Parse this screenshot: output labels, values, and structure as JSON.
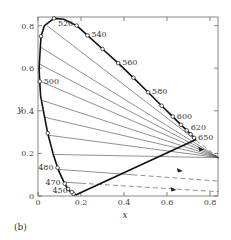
{
  "chart_data": {
    "type": "line",
    "title": "",
    "panel_label": "(b)",
    "xlabel": "x",
    "ylabel": "y",
    "xlim": [
      0,
      0.84
    ],
    "ylim": [
      0,
      0.84
    ],
    "grid": false,
    "x_ticks": [
      0,
      0.2,
      0.4,
      0.6,
      0.8
    ],
    "x_tick_labels": [
      "0",
      "0.2",
      "0.4",
      "0.6",
      "0.8"
    ],
    "y_ticks": [
      0,
      0.2,
      0.4,
      0.6,
      0.8
    ],
    "y_tick_labels": [
      "0",
      "0.2",
      "0.4",
      "0.6",
      "0.8"
    ],
    "series": [
      {
        "name": "spectral-locus",
        "style": "thick-solid",
        "points": [
          [
            0.175,
            0.005
          ],
          [
            0.165,
            0.01
          ],
          [
            0.15,
            0.02
          ],
          [
            0.135,
            0.04
          ],
          [
            0.124,
            0.058
          ],
          [
            0.1,
            0.11
          ],
          [
            0.091,
            0.133
          ],
          [
            0.07,
            0.2
          ],
          [
            0.045,
            0.295
          ],
          [
            0.025,
            0.4
          ],
          [
            0.012,
            0.47
          ],
          [
            0.008,
            0.538
          ],
          [
            0.005,
            0.6
          ],
          [
            0.01,
            0.68
          ],
          [
            0.014,
            0.75
          ],
          [
            0.03,
            0.8
          ],
          [
            0.074,
            0.834
          ],
          [
            0.12,
            0.83
          ],
          [
            0.18,
            0.8
          ],
          [
            0.23,
            0.754
          ],
          [
            0.3,
            0.69
          ],
          [
            0.373,
            0.624
          ],
          [
            0.444,
            0.555
          ],
          [
            0.512,
            0.487
          ],
          [
            0.575,
            0.424
          ],
          [
            0.627,
            0.373
          ],
          [
            0.665,
            0.334
          ],
          [
            0.692,
            0.308
          ],
          [
            0.71,
            0.29
          ],
          [
            0.735,
            0.265
          ]
        ]
      },
      {
        "name": "purple-line",
        "style": "thick-solid",
        "points": [
          [
            0.175,
            0.005
          ],
          [
            0.735,
            0.265
          ]
        ]
      }
    ],
    "wavelength_markers": [
      {
        "nm": 450,
        "x": 0.157,
        "y": 0.018,
        "label": "450"
      },
      {
        "nm": 470,
        "x": 0.124,
        "y": 0.058,
        "label": "470"
      },
      {
        "nm": 480,
        "x": 0.091,
        "y": 0.133,
        "label": "480"
      },
      {
        "nm": 500,
        "x": 0.008,
        "y": 0.538,
        "label": "500"
      },
      {
        "nm": 520,
        "x": 0.074,
        "y": 0.834,
        "label": "520"
      },
      {
        "nm": 540,
        "x": 0.23,
        "y": 0.754,
        "label": "540"
      },
      {
        "nm": 560,
        "x": 0.373,
        "y": 0.624,
        "label": "560"
      },
      {
        "nm": 580,
        "x": 0.512,
        "y": 0.487,
        "label": "580"
      },
      {
        "nm": 600,
        "x": 0.627,
        "y": 0.373,
        "label": "600"
      },
      {
        "nm": 620,
        "x": 0.692,
        "y": 0.308,
        "label": "620"
      },
      {
        "nm": 650,
        "x": 0.726,
        "y": 0.273,
        "label": "650"
      }
    ],
    "unlabeled_markers": [
      [
        0.165,
        0.01
      ],
      [
        0.14,
        0.033
      ],
      [
        0.045,
        0.295
      ],
      [
        0.014,
        0.75
      ],
      [
        0.18,
        0.8
      ],
      [
        0.3,
        0.69
      ],
      [
        0.444,
        0.555
      ],
      [
        0.575,
        0.424
      ],
      [
        0.665,
        0.334
      ],
      [
        0.71,
        0.29
      ]
    ],
    "projection_lines": {
      "style": "thin-solid",
      "description": "Straight lines from points on the spectral locus converging toward the lower right, continuing as dashed lines with arrowheads beyond x≈0.72",
      "lines": [
        {
          "from": [
            0.042,
            0.8
          ],
          "to": [
            0.84,
            0.18
          ],
          "dashed_after_x": 0.735
        },
        {
          "from": [
            0.01,
            0.7
          ],
          "to": [
            0.84,
            0.18
          ]
        },
        {
          "from": [
            0.006,
            0.62
          ],
          "to": [
            0.84,
            0.18
          ]
        },
        {
          "from": [
            0.008,
            0.54
          ],
          "to": [
            0.84,
            0.18
          ]
        },
        {
          "from": [
            0.015,
            0.45
          ],
          "to": [
            0.84,
            0.18
          ]
        },
        {
          "from": [
            0.03,
            0.37
          ],
          "to": [
            0.84,
            0.18
          ]
        },
        {
          "from": [
            0.05,
            0.285
          ],
          "to": [
            0.84,
            0.18
          ]
        },
        {
          "from": [
            0.075,
            0.195
          ],
          "to": [
            0.84,
            0.18
          ]
        },
        {
          "from": [
            0.095,
            0.125
          ],
          "to": [
            0.84,
            0.07
          ],
          "dashed_after_x": 0.44
        },
        {
          "from": [
            0.12,
            0.065
          ],
          "to": [
            0.84,
            0.02
          ],
          "dashed_after_x": 0.2
        }
      ],
      "arrows": [
        [
          0.76,
          0.22
        ],
        [
          0.66,
          0.12
        ],
        [
          0.63,
          0.03
        ]
      ]
    }
  }
}
